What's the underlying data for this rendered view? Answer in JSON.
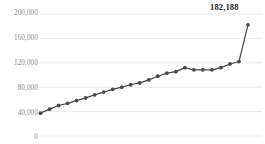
{
  "chart_data": {
    "type": "line",
    "title": "",
    "subtitle": "",
    "xlabel": "",
    "ylabel": "",
    "ylim": [
      0,
      200000
    ],
    "ytick_labels": [
      "200,000",
      "160,000",
      "120,000",
      "80,000",
      "40,000",
      "0"
    ],
    "ytick_values": [
      200000,
      160000,
      120000,
      80000,
      40000,
      0
    ],
    "grid": true,
    "grid_axis": "y",
    "legend": false,
    "legend_position": "none",
    "marker": "circle",
    "series_color": "#4a4a4a",
    "grid_color": "#e6e6e6",
    "label_color": "#8a8a8a",
    "annotations": [
      {
        "text": "182,188",
        "value": 182188,
        "point_index": 23,
        "position": "above-right"
      }
    ],
    "x": [
      1,
      2,
      3,
      4,
      5,
      6,
      7,
      8,
      9,
      10,
      11,
      12,
      13,
      14,
      15,
      16,
      17,
      18,
      19,
      20,
      21,
      22,
      23,
      24
    ],
    "values": [
      37500,
      44000,
      50000,
      53500,
      58000,
      62500,
      67500,
      72000,
      76500,
      80000,
      84000,
      87000,
      92000,
      98000,
      103000,
      105500,
      112000,
      108500,
      108500,
      108500,
      112000,
      118000,
      122000,
      182188
    ],
    "series": [
      {
        "name": "Series 1",
        "color": "#4a4a4a",
        "values": [
          37500,
          44000,
          50000,
          53500,
          58000,
          62500,
          67500,
          72000,
          76500,
          80000,
          84000,
          87000,
          92000,
          98000,
          103000,
          105500,
          112000,
          108500,
          108500,
          108500,
          112000,
          118000,
          122000,
          182188
        ]
      }
    ]
  }
}
